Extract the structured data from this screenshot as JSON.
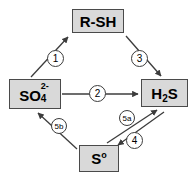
{
  "diagram": {
    "type": "cycle-diagram",
    "colors": {
      "node_fill": "#d9d9d9",
      "node_border": "#4a4a4a",
      "arrow": "#3c3c3c",
      "badge_fill": "#ffffff",
      "background": "#ffffff"
    },
    "nodes": [
      {
        "id": "rsh",
        "label": "R-SH",
        "formula_parts": {
          "main": "R-SH"
        }
      },
      {
        "id": "sulfate",
        "label": "SO42-",
        "formula_parts": {
          "main": "SO",
          "sub": "4",
          "sup": "2-"
        }
      },
      {
        "id": "h2s",
        "label": "H2S",
        "formula_parts": {
          "pre": "H",
          "sub": "2",
          "post": "S"
        }
      },
      {
        "id": "s0",
        "label": "So",
        "formula_parts": {
          "pre": "S",
          "sup": "o"
        }
      }
    ],
    "arrows": [
      {
        "id": "step-1",
        "badge": "1",
        "from": "sulfate",
        "to": "rsh",
        "direction": "up-right"
      },
      {
        "id": "step-2",
        "badge": "2",
        "from": "sulfate",
        "to": "h2s",
        "direction": "right"
      },
      {
        "id": "step-3",
        "badge": "3",
        "from": "rsh",
        "to": "h2s",
        "direction": "down-right"
      },
      {
        "id": "step-4",
        "badge": "4",
        "from": "h2s",
        "to": "s0",
        "direction": "down-left"
      },
      {
        "id": "step-5a",
        "badge": "5a",
        "from": "s0",
        "to": "h2s",
        "direction": "up-right"
      },
      {
        "id": "step-5b",
        "badge": "5b",
        "from": "s0",
        "to": "sulfate",
        "direction": "up-left"
      }
    ]
  }
}
